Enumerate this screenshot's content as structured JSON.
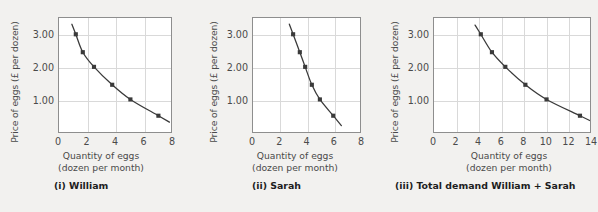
{
  "chart_data": [
    {
      "type": "line",
      "title": "(i) William",
      "xlabel": "Quantity of eggs",
      "xlabel_sub": "(dozen per month)",
      "ylabel": "Price of eggs (£ per dozen)",
      "xlim": [
        0,
        8
      ],
      "ylim": [
        0,
        3.5
      ],
      "xticks": [
        0,
        2,
        4,
        6,
        8
      ],
      "xticklabels": [
        "0",
        "2",
        "4",
        "6",
        "8"
      ],
      "yticks": [
        1.0,
        2.0,
        3.0
      ],
      "yticklabels": [
        "1.00",
        "2.00",
        "3.00"
      ],
      "grid": true,
      "series": [
        {
          "name": "William demand",
          "x": [
            1.2,
            1.7,
            2.5,
            3.8,
            5.1,
            7.1
          ],
          "y": [
            3.0,
            2.45,
            2.0,
            1.45,
            1.0,
            0.5
          ]
        }
      ]
    },
    {
      "type": "line",
      "title": "(ii) Sarah",
      "xlabel": "Quantity of eggs",
      "xlabel_sub": "(dozen per month)",
      "ylabel": "Price of eggs (£ per dozen)",
      "xlim": [
        0,
        8
      ],
      "ylim": [
        0,
        3.5
      ],
      "xticks": [
        0,
        2,
        4,
        6,
        8
      ],
      "xticklabels": [
        "0",
        "2",
        "4",
        "6",
        "8"
      ],
      "yticks": [
        1.0,
        2.0,
        3.0
      ],
      "yticklabels": [
        "1.00",
        "2.00",
        "3.00"
      ],
      "grid": true,
      "series": [
        {
          "name": "Sarah demand",
          "x": [
            3.0,
            3.5,
            3.9,
            4.4,
            5.0,
            6.0
          ],
          "y": [
            3.0,
            2.45,
            2.0,
            1.45,
            1.0,
            0.5
          ]
        }
      ]
    },
    {
      "type": "line",
      "title": "(iii) Total demand William + Sarah",
      "xlabel": "Quantity of eggs",
      "xlabel_sub": "(dozen per month)",
      "ylabel": "Price of eggs (£ per dozen)",
      "xlim": [
        0,
        14
      ],
      "ylim": [
        0,
        3.5
      ],
      "xticks": [
        0,
        2,
        4,
        6,
        8,
        10,
        12,
        14
      ],
      "xticklabels": [
        "0",
        "2",
        "4",
        "6",
        "8",
        "10",
        "12",
        "14"
      ],
      "yticks": [
        1.0,
        2.0,
        3.0
      ],
      "yticklabels": [
        "1.00",
        "2.00",
        "3.00"
      ],
      "grid": true,
      "series": [
        {
          "name": "Total demand",
          "x": [
            4.2,
            5.2,
            6.4,
            8.2,
            10.1,
            13.1
          ],
          "y": [
            3.0,
            2.45,
            2.0,
            1.45,
            1.0,
            0.5
          ]
        }
      ]
    }
  ],
  "style": {
    "curve_color": "#3a3a3a",
    "marker_color": "#3a3a3a",
    "grid_color": "#d9d9d9",
    "frame_color": "#8e8e8e",
    "background": "#f2f1ef",
    "plot_background": "#ffffff",
    "text_color": "#4a4a4a"
  }
}
